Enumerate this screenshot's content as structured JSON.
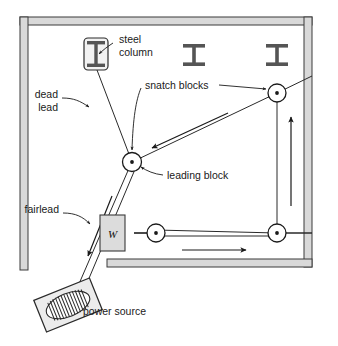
{
  "diagram": {
    "type": "engineering-plan-diagram",
    "colors": {
      "wall_fill": "#d9d9d9",
      "wall_stroke": "#3a3a3a",
      "line": "#1a1a1a",
      "rope": "#4a4a4a",
      "block_fill": "#ffffff",
      "weight_fill": "#dcdcdc",
      "text": "#1a1a1a",
      "background": "#ffffff"
    }
  },
  "labels": {
    "steel_column": {
      "line1": "steel",
      "line2": "column"
    },
    "dead_lead": {
      "line1": "dead",
      "line2": "lead"
    },
    "snatch_blocks": "snatch blocks",
    "leading_block": "leading block",
    "fairlead": "fairlead",
    "power_source": "power source",
    "weight": "W"
  },
  "components": [
    {
      "name": "steel-column",
      "kind": "column",
      "x": 96,
      "y": 52
    },
    {
      "name": "i-beam-center",
      "kind": "i-beam",
      "x": 194,
      "y": 55
    },
    {
      "name": "i-beam-right",
      "kind": "i-beam",
      "x": 277,
      "y": 55
    },
    {
      "name": "leading-block",
      "kind": "pulley",
      "x": 132,
      "y": 162
    },
    {
      "name": "snatch-block-upper-right",
      "kind": "pulley",
      "x": 277,
      "y": 93
    },
    {
      "name": "snatch-block-lower-left",
      "kind": "pulley",
      "x": 156,
      "y": 233
    },
    {
      "name": "snatch-block-lower-right",
      "kind": "pulley",
      "x": 277,
      "y": 233
    },
    {
      "name": "weight-block",
      "kind": "weight",
      "x": 117,
      "y": 233
    },
    {
      "name": "power-source",
      "kind": "winch",
      "x": 68,
      "y": 305
    }
  ],
  "arrows": [
    {
      "name": "rope-arrow-to-leading-block",
      "direction": "down-left"
    },
    {
      "name": "rope-arrow-vertical-up",
      "direction": "up"
    },
    {
      "name": "rope-arrow-horizontal-right",
      "direction": "right"
    },
    {
      "name": "rope-arrow-to-power-source",
      "direction": "down-left"
    }
  ],
  "walls": {
    "note": "room perimeter shown in plan; bottom wall has an opening at left"
  }
}
